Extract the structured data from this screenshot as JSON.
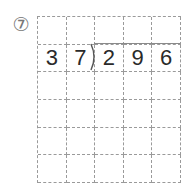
{
  "problem": {
    "number_label": "⑦",
    "divisor": "37",
    "dividend": "296"
  },
  "grid": {
    "columns": 5,
    "rows": 6,
    "cells": [
      [
        "",
        "",
        "",
        "",
        ""
      ],
      [
        "3",
        "7",
        "2",
        "9",
        "6"
      ],
      [
        "",
        "",
        "",
        "",
        ""
      ],
      [
        "",
        "",
        "",
        "",
        ""
      ],
      [
        "",
        "",
        "",
        "",
        ""
      ],
      [
        "",
        "",
        "",
        "",
        ""
      ]
    ]
  },
  "colors": {
    "grid_line": "#9a9a9a",
    "digit": "#2a2a2a",
    "division_bar": "#8a8a8a"
  }
}
